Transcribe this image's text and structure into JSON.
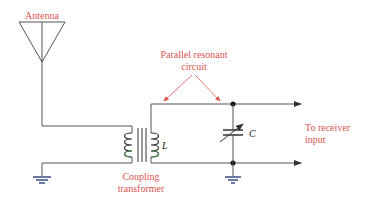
{
  "diagram": {
    "labels": {
      "antenna": "Antenna",
      "parallel_resonant_line1": "Parallel resonant",
      "parallel_resonant_line2": "circuit",
      "coupling_line1": "Coupling",
      "coupling_line2": "transformer",
      "receiver_line1": "To receiver",
      "receiver_line2": "input",
      "inductor": "L",
      "capacitor": "C"
    },
    "colors": {
      "label": "#d9534f",
      "wire": "#555555",
      "coil_primary": "#333333",
      "coil_secondary": "#4a8a4a",
      "ground": "#3a4a8a"
    },
    "components": [
      "antenna",
      "coupling-transformer",
      "inductor-L",
      "variable-capacitor-C",
      "ground",
      "ground",
      "output-terminals"
    ]
  }
}
